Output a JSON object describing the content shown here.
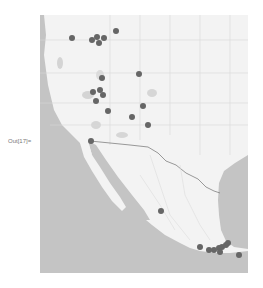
{
  "notebook": {
    "cutoff_text": "",
    "output_label": "Out[17]="
  },
  "map": {
    "style": "grayscale",
    "colors": {
      "land": "#f3f3f3",
      "water": "#c4c4c4",
      "borders": "#7a7a7a",
      "roads": "#dedede",
      "marker": "#666666"
    },
    "region": "Western United States and Mexico",
    "markers": [
      {
        "x": 72,
        "y": 38
      },
      {
        "x": 92,
        "y": 40
      },
      {
        "x": 97,
        "y": 37
      },
      {
        "x": 99,
        "y": 43
      },
      {
        "x": 104,
        "y": 38
      },
      {
        "x": 116,
        "y": 31
      },
      {
        "x": 102,
        "y": 78
      },
      {
        "x": 93,
        "y": 92
      },
      {
        "x": 100,
        "y": 90
      },
      {
        "x": 103,
        "y": 95
      },
      {
        "x": 96,
        "y": 101
      },
      {
        "x": 108,
        "y": 111
      },
      {
        "x": 139,
        "y": 74
      },
      {
        "x": 143,
        "y": 106
      },
      {
        "x": 132,
        "y": 117
      },
      {
        "x": 148,
        "y": 125
      },
      {
        "x": 91,
        "y": 141
      },
      {
        "x": 161,
        "y": 211
      },
      {
        "x": 200,
        "y": 247
      },
      {
        "x": 209,
        "y": 250
      },
      {
        "x": 214,
        "y": 250
      },
      {
        "x": 219,
        "y": 248
      },
      {
        "x": 222,
        "y": 247
      },
      {
        "x": 226,
        "y": 245
      },
      {
        "x": 228,
        "y": 243
      },
      {
        "x": 220,
        "y": 252
      },
      {
        "x": 239,
        "y": 255
      }
    ]
  }
}
